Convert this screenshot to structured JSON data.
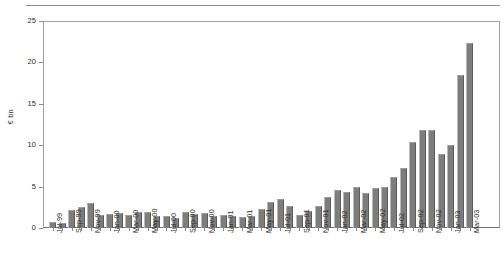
{
  "chart_data": {
    "type": "bar",
    "title": "",
    "subtitle": "",
    "xlabel": "",
    "ylabel": "€ bn",
    "ylim": [
      0,
      25
    ],
    "yticks": [
      0,
      5,
      10,
      15,
      20,
      25
    ],
    "ytick_labels": [
      "0",
      "5",
      "10",
      "15",
      "20",
      "25"
    ],
    "grid": false,
    "legend": null,
    "bar_color": "#7d7d7d",
    "categories": [
      "Jul-99",
      "Aug-99",
      "Sep-99",
      "Oct-99",
      "Nov-99",
      "Dec-99",
      "Jan-00",
      "Feb-00",
      "Mar-00",
      "Apr-00",
      "May-00",
      "Jun-00",
      "Jul-00",
      "Aug-00",
      "Sep-00",
      "Oct-00",
      "Nov-00",
      "Dec-00",
      "Jan-01",
      "Feb-01",
      "Mar-01",
      "Apr-01",
      "May-01",
      "Jun-01",
      "Jul-01",
      "Aug-01",
      "Sep-01",
      "Oct-01",
      "Nov-01",
      "Dec-01",
      "Jan-02",
      "Feb-02",
      "Mar-02",
      "Apr-02",
      "May-02",
      "Jun-02",
      "Jul-02",
      "Aug-02",
      "Sep-02",
      "Oct-02",
      "Nov-02",
      "Dec-02",
      "Jan-03",
      "Feb-03",
      "Mar-03"
    ],
    "values": [
      0.7,
      0.6,
      2.2,
      2.5,
      3.0,
      1.6,
      1.7,
      1.8,
      1.6,
      1.9,
      1.9,
      1.5,
      1.4,
      1.2,
      1.9,
      1.7,
      1.8,
      1.5,
      1.6,
      1.5,
      1.3,
      1.5,
      2.3,
      3.2,
      3.5,
      2.6,
      1.6,
      2.0,
      2.7,
      3.8,
      4.6,
      4.3,
      5.0,
      4.2,
      4.8,
      4.9,
      6.2,
      7.2,
      10.4,
      11.8,
      11.8,
      8.9,
      10.0,
      18.5,
      22.4
    ],
    "tick_label_interval": 2,
    "axis_labels_shown": [
      "Jul-99",
      "Sep-99",
      "Nov-99",
      "Jan-00",
      "Mar-00",
      "May-00",
      "Jul-00",
      "Sep-00",
      "Nov-00",
      "Jan-01",
      "Mar-01",
      "May-01",
      "Jul-01",
      "Sep-01",
      "Nov-01",
      "Jan-02",
      "Mar-02",
      "May-02",
      "Jul-02",
      "Sep-02",
      "Nov-02",
      "Jan-03",
      "Mar-03"
    ]
  }
}
